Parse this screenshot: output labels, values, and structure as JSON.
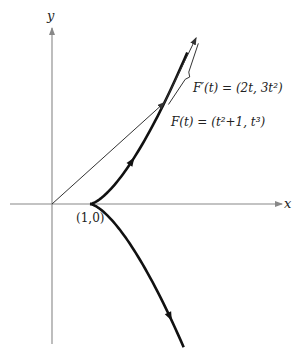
{
  "diagram": {
    "type": "parametric-curve",
    "function": {
      "x_expr": "t^2+1",
      "y_expr": "t^3",
      "t_range": [
        -1.57,
        1.6
      ]
    },
    "sample_t": 1.4,
    "axes": {
      "x_label": "x",
      "y_label": "y"
    },
    "labels": {
      "cusp_point": "(1,0)",
      "position": "F(t) = (t²+1, t³)",
      "derivative": "F′(t) = (2t, 3t²)"
    },
    "colors": {
      "curve": "#111111",
      "axis": "#888888",
      "vector": "#333333"
    }
  }
}
